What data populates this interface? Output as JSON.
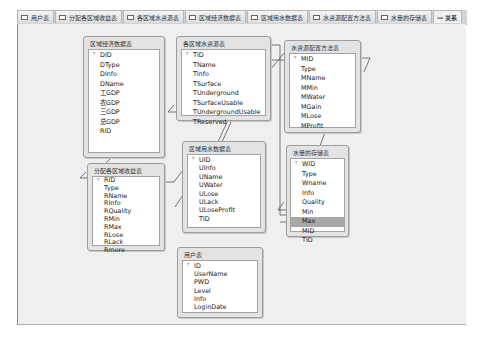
{
  "tabs": [
    {
      "label": "用户表",
      "active": false
    },
    {
      "label": "分配各区域收益表",
      "active": false
    },
    {
      "label": "各区域水资源表",
      "active": false
    },
    {
      "label": "区域经济数据表",
      "active": false
    },
    {
      "label": "区域用水数据表",
      "active": false
    },
    {
      "label": "水资源配置方法表",
      "active": false
    },
    {
      "label": "水量的存储表",
      "active": false
    },
    {
      "label": "关系",
      "active": true
    }
  ],
  "tables": {
    "economy": {
      "title": "区域经济数据表",
      "fields": [
        "DID",
        "DType",
        "DInfo",
        "DName",
        "工GDP",
        "农GDP",
        "三GDP",
        "总GDP",
        "RID"
      ]
    },
    "water_resource": {
      "title": "各区域水资源表",
      "fields": [
        "TID",
        "TName",
        "TInfo",
        "TSurface",
        "TUnderground",
        "TSurfaceUsable",
        "TUndergroundUsable",
        "TReserved"
      ]
    },
    "allocation_method": {
      "title": "水资源配置方法表",
      "fields": [
        "MID",
        "Type",
        "MName",
        "MMin",
        "MWater",
        "MGain",
        "MLose",
        "MProfit"
      ]
    },
    "storage": {
      "title": "水量的存储表",
      "fields": [
        "WID",
        "Type",
        "Wname",
        "Info",
        "Quality",
        "Min",
        "Max",
        "MID",
        "TID"
      ],
      "selected_field": "Max"
    },
    "benefit": {
      "title": "分配各区域收益表",
      "fields": [
        "RID",
        "Type",
        "RName",
        "RInfo",
        "RQuality",
        "RMin",
        "RMax",
        "RLose",
        "RLack",
        "Rmore"
      ]
    },
    "usage": {
      "title": "区域用水数据表",
      "fields": [
        "UID",
        "UInfo",
        "UName",
        "UWater",
        "ULose",
        "ULack",
        "ULoseProfit",
        "TID"
      ]
    },
    "users": {
      "title": "用户表",
      "fields": [
        "ID",
        "UserName",
        "PWD",
        "Level",
        "Info",
        "LoginDate"
      ]
    }
  },
  "colors": {
    "canvas": "#efefef",
    "table_frame": "#e3e3e3",
    "selected_row": "#a8a8a8"
  }
}
